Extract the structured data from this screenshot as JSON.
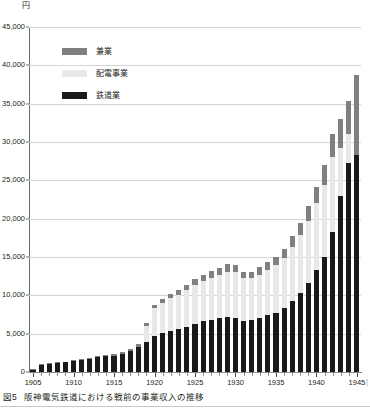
{
  "figure": {
    "unit_label": "円",
    "caption_number": "図5",
    "caption_text": "阪神電気鉄道における戦前の事業収入の推移",
    "edge_mark": "|"
  },
  "legend": {
    "position": "inside-top-left",
    "items": [
      {
        "label": "兼業",
        "color": "#808080"
      },
      {
        "label": "配電事業",
        "color": "#e8e8e8"
      },
      {
        "label": "鉄道業",
        "color": "#1a1a1a"
      }
    ]
  },
  "axes": {
    "y": {
      "title": "円",
      "min": 0,
      "max": 45000,
      "step": 5000,
      "ticks": [
        0,
        5000,
        10000,
        15000,
        20000,
        25000,
        30000,
        35000,
        40000,
        45000
      ],
      "tick_labels": [
        "0",
        "5,000",
        "10,000",
        "15,000",
        "20,000",
        "25,000",
        "30,000",
        "35,000",
        "40,000",
        "45,000"
      ]
    },
    "x": {
      "min": 1905,
      "max": 1945,
      "major_step": 5,
      "major_ticks": [
        1905,
        1910,
        1915,
        1920,
        1925,
        1930,
        1935,
        1940,
        1945
      ],
      "major_tick_labels": [
        "1905",
        "1910",
        "1915",
        "1920",
        "1925",
        "1930",
        "1935",
        "1940",
        "1945"
      ]
    }
  },
  "chart_data": {
    "type": "bar",
    "stacked": true,
    "title": "阪神電気鉄道における戦前の事業収入の推移",
    "xlabel": "",
    "ylabel": "円",
    "ylim": [
      0,
      45000
    ],
    "grid": true,
    "legend_position": "inside-top-left",
    "categories": [
      "1905",
      "1906",
      "1907",
      "1908",
      "1909",
      "1910",
      "1911",
      "1912",
      "1913",
      "1914",
      "1915",
      "1916",
      "1917",
      "1918",
      "1919",
      "1920",
      "1921",
      "1922",
      "1923",
      "1924",
      "1925",
      "1926",
      "1927",
      "1928",
      "1929",
      "1930",
      "1931",
      "1932",
      "1933",
      "1934",
      "1935",
      "1936",
      "1937",
      "1938",
      "1939",
      "1940",
      "1941",
      "1942",
      "1943",
      "1944",
      "1945"
    ],
    "series": [
      {
        "name": "鉄道業",
        "color": "#1a1a1a",
        "values": [
          300,
          900,
          1100,
          1150,
          1250,
          1400,
          1550,
          1700,
          1900,
          2050,
          2150,
          2400,
          2750,
          3300,
          3900,
          4700,
          5100,
          5400,
          5600,
          5900,
          6300,
          6600,
          6800,
          7000,
          7200,
          7100,
          6700,
          6800,
          7100,
          7400,
          7700,
          8300,
          9200,
          10300,
          11600,
          13300,
          15000,
          18200,
          22900,
          27200,
          28300
        ]
      },
      {
        "name": "配電事業",
        "color": "#e8e8e8",
        "values": [
          0,
          0,
          0,
          0,
          0,
          0,
          0,
          0,
          0,
          0,
          0,
          0,
          0,
          0,
          2100,
          3600,
          3900,
          4200,
          4500,
          4800,
          5100,
          5300,
          5500,
          5700,
          5900,
          5900,
          5500,
          5400,
          5600,
          5900,
          6200,
          6600,
          7100,
          7600,
          8100,
          8700,
          9400,
          9900,
          6300,
          3900,
          0
        ]
      },
      {
        "name": "兼業",
        "color": "#808080",
        "values": [
          50,
          80,
          100,
          110,
          120,
          130,
          150,
          160,
          180,
          190,
          200,
          220,
          260,
          300,
          350,
          500,
          550,
          600,
          650,
          700,
          750,
          800,
          850,
          900,
          950,
          950,
          900,
          900,
          950,
          1000,
          1100,
          1200,
          1400,
          1600,
          1900,
          2200,
          2600,
          3000,
          3800,
          4300,
          10500
        ]
      }
    ]
  }
}
